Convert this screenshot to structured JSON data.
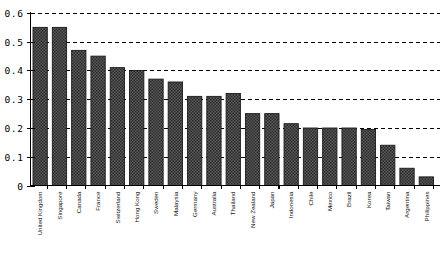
{
  "chart_data": {
    "type": "bar",
    "title": "",
    "subtitle": "",
    "xlabel": "",
    "ylabel": "",
    "ylim": [
      0,
      0.6
    ],
    "yticks": [
      "0",
      "0.1",
      "0.2",
      "0.3",
      "0.4",
      "0.5",
      "0.6"
    ],
    "ytick_values": [
      0,
      0.1,
      0.2,
      0.3,
      0.4,
      0.5,
      0.6
    ],
    "grid": "horizontal-dashed",
    "legend": "none",
    "bar_style": "hatched-dark-checkered",
    "categories": [
      "United Kingdom",
      "Singapore",
      "Canada",
      "France",
      "Switzerland",
      "Hong Kong",
      "Sweden",
      "Malaysia",
      "Germany",
      "Australia",
      "Thailand",
      "New Zealand",
      "Japan",
      "Indonesia",
      "Chile",
      "Mexico",
      "Brazil",
      "Korea",
      "Taiwan",
      "Argentina",
      "Philippines"
    ],
    "values": [
      0.55,
      0.55,
      0.47,
      0.45,
      0.41,
      0.4,
      0.37,
      0.36,
      0.31,
      0.31,
      0.32,
      0.25,
      0.25,
      0.215,
      0.2,
      0.2,
      0.2,
      0.195,
      0.14,
      0.06,
      0.03
    ]
  },
  "colors": {
    "bar_fill": "#4a4a4a",
    "bar_stroke": "#1a1a1a",
    "axis": "#000000",
    "grid": "#000000",
    "background": "#ffffff"
  }
}
